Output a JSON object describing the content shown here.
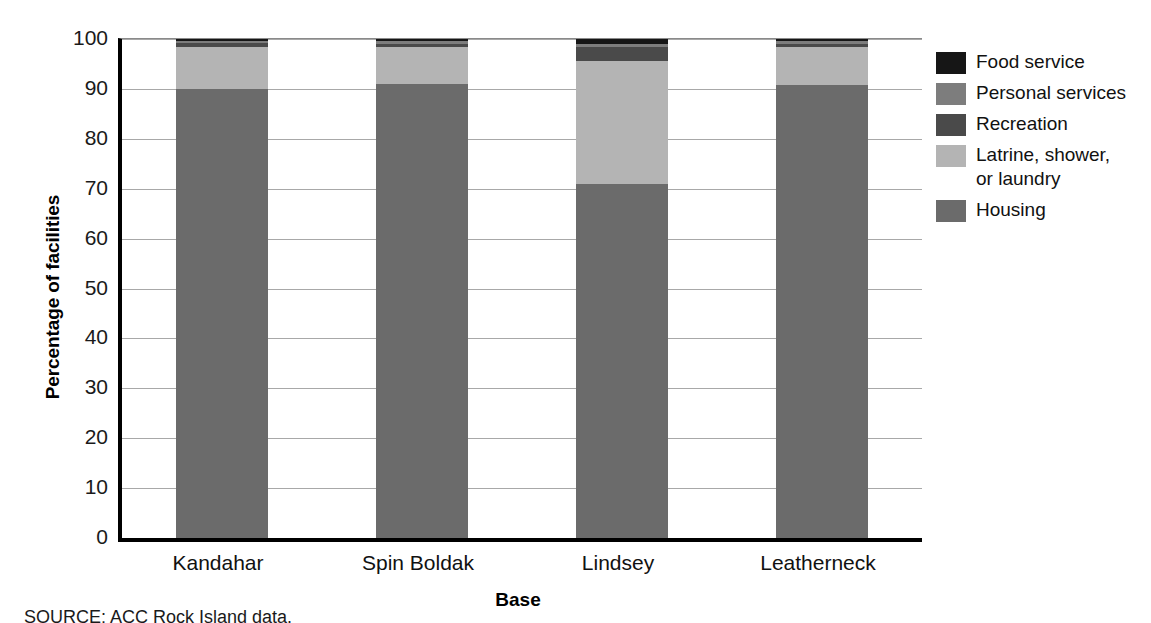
{
  "chart_data": {
    "type": "bar",
    "subtype": "stacked-percentage",
    "title": "",
    "xlabel": "Base",
    "ylabel": "Percentage of facilities",
    "ylim": [
      0,
      100
    ],
    "ytick_step": 10,
    "yticks": [
      "100",
      "90",
      "80",
      "70",
      "60",
      "50",
      "40",
      "30",
      "20",
      "10",
      "0"
    ],
    "grid": true,
    "legend_position": "right",
    "categories": [
      "Kandahar",
      "Spin Boldak",
      "Lindsey",
      "Leatherneck"
    ],
    "series": [
      {
        "name": "Housing",
        "color": "#6b6b6b",
        "values": [
          90.0,
          91.0,
          71.0,
          90.8
        ]
      },
      {
        "name": "Latrine, shower,\nor laundry",
        "color": "#b4b4b4",
        "values": [
          8.5,
          7.5,
          24.5,
          7.6
        ]
      },
      {
        "name": "Recreation",
        "color": "#4a4a4a",
        "values": [
          0.7,
          0.6,
          3.0,
          0.7
        ]
      },
      {
        "name": "Personal services",
        "color": "#7d7d7d",
        "values": [
          0.5,
          0.5,
          0.6,
          0.5
        ]
      },
      {
        "name": "Food service",
        "color": "#161616",
        "values": [
          0.3,
          0.4,
          0.9,
          0.4
        ]
      }
    ],
    "legend_order": [
      "Food service",
      "Personal services",
      "Recreation",
      "Latrine, shower,\nor laundry",
      "Housing"
    ]
  },
  "legend": {
    "items": [
      {
        "label": "Food service",
        "color": "#161616"
      },
      {
        "label": "Personal services",
        "color": "#7d7d7d"
      },
      {
        "label": "Recreation",
        "color": "#4a4a4a"
      },
      {
        "label": "Latrine, shower,\nor laundry",
        "color": "#b4b4b4"
      },
      {
        "label": "Housing",
        "color": "#6b6b6b"
      }
    ]
  },
  "axes": {
    "y_title": "Percentage of facilities",
    "x_title": "Base",
    "y_ticks": [
      "100",
      "90",
      "80",
      "70",
      "60",
      "50",
      "40",
      "30",
      "20",
      "10",
      "0"
    ],
    "x_ticks": [
      "Kandahar",
      "Spin Boldak",
      "Lindsey",
      "Leatherneck"
    ]
  },
  "footer": {
    "source": "SOURCE: ACC Rock Island data."
  },
  "colors": {
    "axis": "#000000",
    "grid": "#a8a8a8",
    "background": "#ffffff",
    "food_service": "#161616",
    "personal_services": "#7d7d7d",
    "recreation": "#4a4a4a",
    "latrine": "#b4b4b4",
    "housing": "#6b6b6b"
  }
}
